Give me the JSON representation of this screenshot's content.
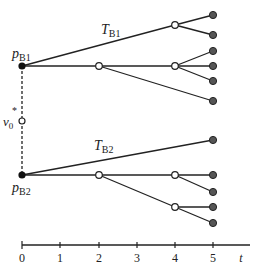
{
  "diagram": {
    "title": "",
    "colors": {
      "line": "#222222",
      "leaf_fill": "#555555",
      "open_fill": "#ffffff",
      "root_fill": "#111111"
    },
    "roots": [
      {
        "id": "pB1",
        "label_main": "p",
        "label_sub": "B1"
      },
      {
        "id": "pB2",
        "label_main": "p",
        "label_sub": "B2"
      }
    ],
    "trees": [
      {
        "id": "TB1",
        "label_main": "T",
        "label_sub": "B1"
      },
      {
        "id": "TB2",
        "label_main": "T",
        "label_sub": "B2"
      }
    ],
    "virtual_node": {
      "label_main": "v",
      "label_sub": "0",
      "label_sup": "*"
    },
    "axis": {
      "label": "t",
      "ticks": [
        "0",
        "1",
        "2",
        "3",
        "4",
        "5"
      ]
    }
  }
}
